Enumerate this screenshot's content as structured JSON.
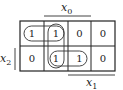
{
  "kmap": {
    "labels": {
      "x0": {
        "var": "x",
        "sub": "0"
      },
      "x1": {
        "var": "x",
        "sub": "1"
      },
      "x2": {
        "var": "x",
        "sub": "2"
      }
    },
    "rows": [
      [
        "1",
        "1",
        "0",
        "0"
      ],
      [
        "0",
        "1",
        "1",
        "0"
      ]
    ],
    "groups": [
      {
        "name": "row0-cols0-1",
        "cells": [
          [
            0,
            0
          ],
          [
            0,
            1
          ]
        ]
      },
      {
        "name": "col1-rows0-1",
        "cells": [
          [
            0,
            1
          ],
          [
            1,
            1
          ]
        ]
      },
      {
        "name": "row1-cols1-2",
        "cells": [
          [
            1,
            1
          ],
          [
            1,
            2
          ]
        ]
      }
    ],
    "line_color": "#222222"
  }
}
